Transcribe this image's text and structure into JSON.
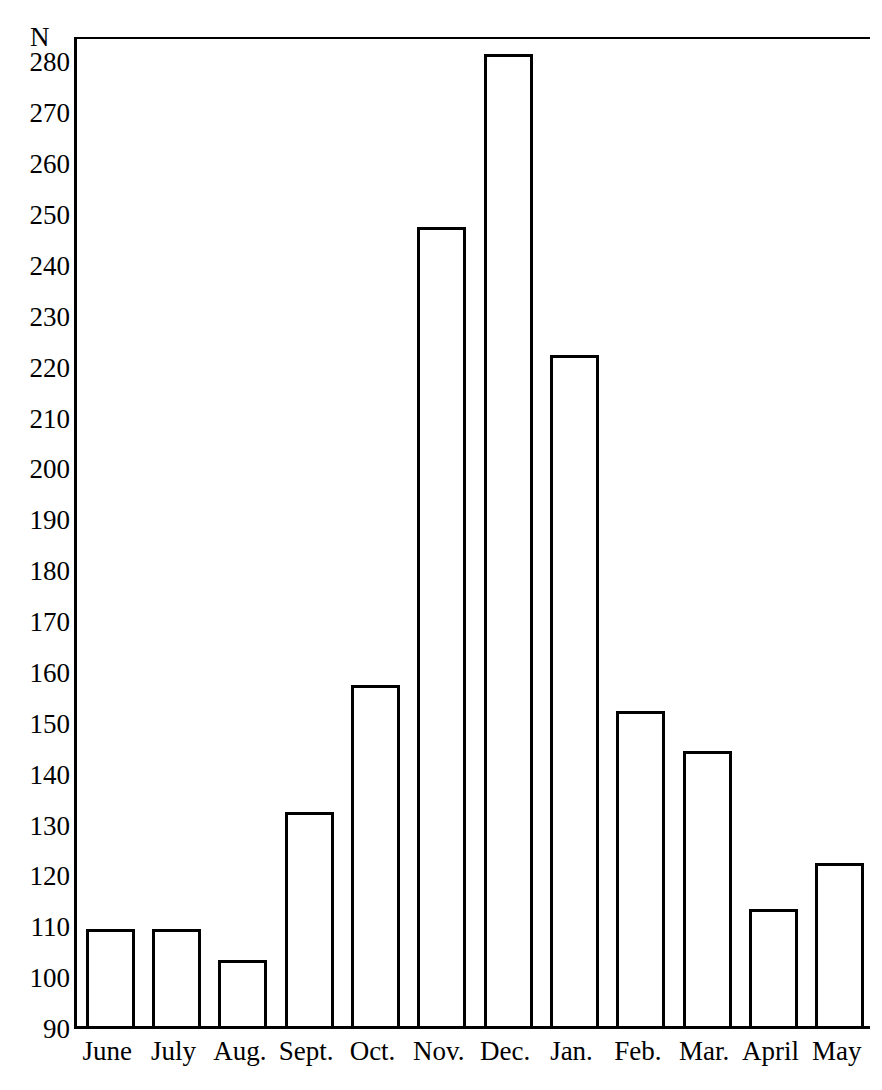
{
  "chart_data": {
    "type": "bar",
    "title": "",
    "xlabel": "",
    "ylabel": "N",
    "categories": [
      "June",
      "July",
      "Aug.",
      "Sept.",
      "Oct.",
      "Nov.",
      "Dec.",
      "Jan.",
      "Feb.",
      "Mar.",
      "April",
      "May"
    ],
    "values": [
      109,
      109,
      103,
      132,
      157,
      247,
      281,
      222,
      152,
      144,
      113,
      122
    ],
    "ylim": [
      90,
      285
    ],
    "yticks": [
      90,
      100,
      110,
      120,
      130,
      140,
      150,
      160,
      170,
      180,
      190,
      200,
      210,
      220,
      230,
      240,
      250,
      260,
      270,
      280
    ],
    "ytick_labels": [
      "90",
      "100",
      "110",
      "120",
      "130",
      "140",
      "150",
      "160",
      "170",
      "180",
      "190",
      "200",
      "210",
      "220",
      "230",
      "240",
      "250",
      "260",
      "270",
      "280"
    ],
    "grid": false,
    "legend": null,
    "bar_fill_color": "#ffffff",
    "bar_edge_color": "#000000",
    "axis_color": "#000000",
    "background_color": "#ffffff"
  }
}
